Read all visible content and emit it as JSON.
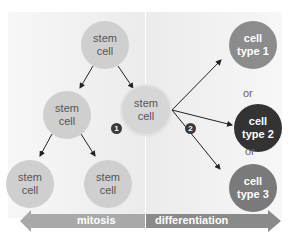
{
  "diagram": {
    "stem_cells": [
      {
        "id": "top",
        "line1": "stem",
        "line2": "cell"
      },
      {
        "id": "mid-left",
        "line1": "stem",
        "line2": "cell"
      },
      {
        "id": "center",
        "line1": "stem",
        "line2": "cell"
      },
      {
        "id": "bottom-left",
        "line1": "stem",
        "line2": "cell"
      },
      {
        "id": "bottom-middle",
        "line1": "stem",
        "line2": "cell"
      }
    ],
    "cell_types": [
      {
        "line1": "cell",
        "line2": "type 1",
        "color": "#8c8c8c"
      },
      {
        "line1": "cell",
        "line2": "type 2",
        "color": "#333333"
      },
      {
        "line1": "cell",
        "line2": "type 3",
        "color": "#7a7a7a"
      }
    ],
    "or_labels": [
      "or",
      "or"
    ],
    "badges": [
      "1",
      "2"
    ],
    "process_bar": {
      "left_label": "mitosis",
      "right_label": "differentiation",
      "left_color": "#a9a9a9",
      "right_color": "#8a8a8a"
    }
  }
}
